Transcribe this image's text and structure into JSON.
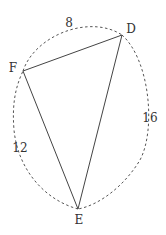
{
  "diagram": {
    "type": "triangle-with-dashed-arcs",
    "vertices": [
      {
        "name": "D",
        "x": 122,
        "y": 35,
        "label_x": 131,
        "label_y": 29
      },
      {
        "name": "F",
        "x": 23,
        "y": 71,
        "label_x": 13,
        "label_y": 68
      },
      {
        "name": "E",
        "x": 78,
        "y": 209,
        "label_x": 79,
        "label_y": 220
      }
    ],
    "edges": [
      {
        "from": "F",
        "to": "D",
        "style": "solid"
      },
      {
        "from": "D",
        "to": "E",
        "style": "solid"
      },
      {
        "from": "E",
        "to": "F",
        "style": "solid"
      }
    ],
    "arcs": [
      {
        "id": "arc-FD",
        "label": "8",
        "label_x": 69,
        "label_y": 23
      },
      {
        "id": "arc-DE",
        "label": "16",
        "label_x": 150,
        "label_y": 118
      },
      {
        "id": "arc-EF",
        "label": "12",
        "label_x": 20,
        "label_y": 148
      }
    ],
    "colors": {
      "line": "#444444",
      "dashed": "#555555",
      "text": "#333333",
      "background": "#ffffff"
    }
  }
}
